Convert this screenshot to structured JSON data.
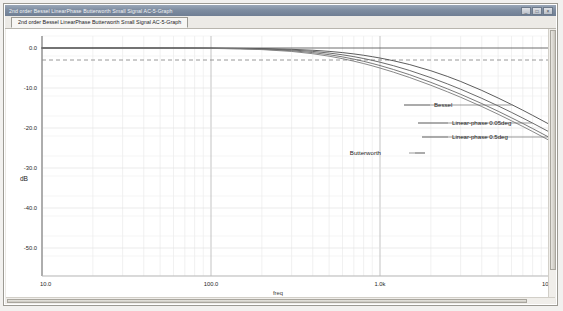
{
  "window": {
    "title": "2nd order Bessel LinearPhase Butterworth Small Signal AC-5-Graph",
    "minimize_label": "_",
    "maximize_label": "□",
    "close_label": "×"
  },
  "tabs": [
    {
      "label": "2nd order Bessel LinearPhase Butterworth Small Signal AC-5-Graph",
      "active": true
    }
  ],
  "chart_data": {
    "type": "line",
    "title": "",
    "xlabel": "freq",
    "ylabel": "dB",
    "xscale": "log",
    "xlim": [
      10,
      10000
    ],
    "ylim": [
      -57,
      3
    ],
    "grid": true,
    "legend_position": "inline-callout",
    "x_ticks": [
      "10.0",
      "100.0",
      "1.0k",
      "10.0k"
    ],
    "x_tick_values": [
      10,
      100,
      1000,
      10000
    ],
    "y_ticks": [
      "0.0",
      "-10.0",
      "-20.0",
      "-30.0",
      "-40.0",
      "-50.0"
    ],
    "y_tick_values": [
      0,
      -10,
      -20,
      -30,
      -40,
      -50
    ],
    "reference_line": {
      "value": -3.0,
      "style": "dashed",
      "label": "-3 dB"
    },
    "x": [
      10,
      20,
      40,
      70,
      100,
      150,
      200,
      300,
      400,
      500,
      600,
      700,
      800,
      900,
      1000,
      1200,
      1500,
      2000,
      2500,
      3000,
      4000,
      5000,
      6000,
      7000,
      8000,
      10000
    ],
    "series": [
      {
        "name": "Bessel",
        "color": "#4a4a4a",
        "values": [
          0.0,
          0.0,
          -0.01,
          -0.02,
          -0.04,
          -0.09,
          -0.15,
          -0.33,
          -0.56,
          -0.84,
          -1.15,
          -1.48,
          -1.82,
          -2.17,
          -2.51,
          -3.18,
          -4.15,
          -5.69,
          -7.09,
          -8.36,
          -10.6,
          -12.5,
          -14.13,
          -15.56,
          -16.84,
          -19.03
        ]
      },
      {
        "name": "Linear-phase 0.05deg",
        "color": "#5a5a5a",
        "values": [
          0.0,
          0.0,
          -0.01,
          -0.03,
          -0.06,
          -0.13,
          -0.23,
          -0.5,
          -0.85,
          -1.26,
          -1.7,
          -2.16,
          -2.63,
          -3.09,
          -3.55,
          -4.42,
          -5.63,
          -7.42,
          -8.96,
          -10.3,
          -12.58,
          -14.48,
          -16.1,
          -17.52,
          -18.78,
          -20.95
        ]
      },
      {
        "name": "Linear-phase 0.5deg",
        "color": "#6a6a6a",
        "values": [
          0.0,
          0.0,
          -0.01,
          -0.04,
          -0.08,
          -0.18,
          -0.31,
          -0.68,
          -1.15,
          -1.67,
          -2.22,
          -2.78,
          -3.33,
          -3.87,
          -4.39,
          -5.37,
          -6.69,
          -8.59,
          -10.19,
          -11.57,
          -13.89,
          -15.81,
          -17.45,
          -18.87,
          -20.14,
          -22.31
        ]
      },
      {
        "name": "Butterworth",
        "color": "#7a7a7a",
        "values": [
          0.0,
          0.0,
          -0.02,
          -0.05,
          -0.1,
          -0.23,
          -0.4,
          -0.86,
          -1.43,
          -2.05,
          -2.67,
          -3.29,
          -3.89,
          -4.46,
          -5.01,
          -6.03,
          -7.39,
          -9.32,
          -10.93,
          -12.31,
          -14.64,
          -16.56,
          -18.2,
          -19.62,
          -20.89,
          -23.06
        ]
      }
    ],
    "callouts": [
      {
        "label": "Bessel",
        "series": "Bessel"
      },
      {
        "label": "Linear-phase 0.05deg",
        "series": "Linear-phase 0.05deg"
      },
      {
        "label": "Linear-phase 0.5deg",
        "series": "Linear-phase 0.5deg"
      },
      {
        "label": "Butterworth",
        "series": "Butterworth"
      }
    ]
  }
}
